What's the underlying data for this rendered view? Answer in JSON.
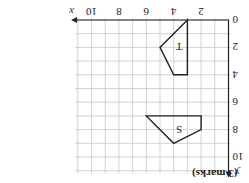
{
  "marks_label": "(3 marks)",
  "axes": {
    "x_label": "x",
    "y_label": "y",
    "x_ticks": [
      "0",
      "2",
      "4",
      "6",
      "8",
      "10"
    ],
    "y_ticks": [
      "0",
      "2",
      "4",
      "6",
      "8",
      "10"
    ],
    "x_range": [
      0,
      11
    ],
    "y_range": [
      0,
      11
    ]
  },
  "shapes": [
    {
      "label": "T",
      "vertices": [
        [
          3,
          0
        ],
        [
          5,
          2
        ],
        [
          4,
          4
        ],
        [
          3,
          4
        ]
      ],
      "label_pos": [
        3.6,
        2
      ]
    },
    {
      "label": "S",
      "vertices": [
        [
          2,
          7
        ],
        [
          6,
          7
        ],
        [
          4,
          9
        ],
        [
          2,
          8
        ]
      ],
      "label_pos": [
        3.6,
        8
      ]
    }
  ],
  "orientation": "rotated 180 degrees",
  "colors": {
    "line": "#222222",
    "grid": "#c8c8c8"
  }
}
